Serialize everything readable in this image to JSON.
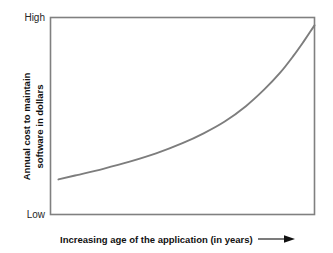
{
  "chart_data": {
    "type": "line",
    "title": "",
    "subtitle": "",
    "xlabel": "Increasing age of the application (in years)",
    "ylabel": "Annual cost to maintain software in dollars",
    "ylabel_lines": [
      "Annual cost to maintain",
      "software in dollars"
    ],
    "ytick_labels": [
      "High",
      "Low"
    ],
    "xtick_labels": [],
    "xlim": [
      0,
      10
    ],
    "ylim": [
      0,
      10
    ],
    "grid": false,
    "legend": null,
    "legend_position": "none",
    "series": [
      {
        "name": "Annual maintenance cost",
        "x": [
          0.3,
          1.0,
          2.0,
          3.0,
          4.0,
          5.0,
          5.8,
          6.6,
          7.4,
          8.1,
          8.7,
          9.2,
          9.6,
          9.85,
          10.0
        ],
        "y": [
          1.78,
          2.0,
          2.32,
          2.68,
          3.1,
          3.62,
          4.12,
          4.72,
          5.5,
          6.35,
          7.2,
          8.05,
          8.8,
          9.3,
          9.6
        ]
      }
    ],
    "annotations": [
      {
        "name": "x-axis-direction-arrow",
        "symbol": "→",
        "meaning": "increasing"
      }
    ],
    "colors": {
      "curve": "#7d7d7d",
      "frame": "#808080",
      "text": "#111111",
      "background": "#ffffff"
    }
  },
  "axes": {
    "y_high_label": "High",
    "y_low_label": "Low",
    "y_title_line1": "Annual cost to maintain",
    "y_title_line2": "software in dollars",
    "x_title": "Increasing age of the application (in years)"
  }
}
